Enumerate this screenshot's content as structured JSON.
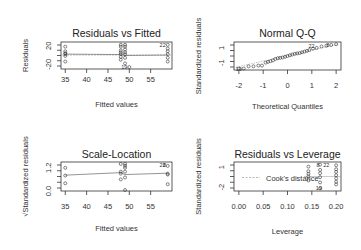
{
  "chart_data": [
    {
      "type": "scatter",
      "title": "Residuals vs Fitted",
      "xlabel": "Fitted values",
      "ylabel": "Residuals",
      "xlim": [
        34,
        60
      ],
      "ylim": [
        -30,
        28
      ],
      "xticks": [
        35,
        40,
        45,
        50,
        55
      ],
      "yticks": [
        -20,
        20
      ],
      "x": [
        35,
        35,
        35,
        35,
        35,
        35,
        48,
        48,
        48,
        48,
        48,
        48,
        48,
        49,
        49,
        49,
        49,
        49,
        49,
        49,
        50,
        59,
        59,
        59,
        59,
        59,
        59
      ],
      "y": [
        18,
        8,
        2,
        -2,
        -14,
        4,
        22,
        18,
        10,
        6,
        2,
        -4,
        -10,
        22,
        18,
        12,
        6,
        2,
        -6,
        -18,
        -26,
        22,
        14,
        8,
        2,
        -6,
        -14
      ],
      "smoother": [
        [
          35,
          2
        ],
        [
          48,
          1
        ],
        [
          49,
          -1
        ],
        [
          59,
          0
        ]
      ],
      "reference_line": 0,
      "labels": [
        {
          "text": "22",
          "x": 59,
          "y": 22
        },
        {
          "text": "19",
          "x": 50,
          "y": -26
        }
      ],
      "grid": false
    },
    {
      "type": "scatter",
      "title": "Normal Q-Q",
      "xlabel": "Theoretical Quantiles",
      "ylabel": "Standardized residuals",
      "xlim": [
        -2.2,
        2.2
      ],
      "ylim": [
        -2,
        1.8
      ],
      "xticks": [
        -2,
        -1,
        0,
        1,
        2
      ],
      "yticks": [
        -1,
        1
      ],
      "x": [
        -2.0,
        -1.8,
        -1.6,
        -1.4,
        -1.2,
        -1.05,
        -0.9,
        -0.8,
        -0.7,
        -0.6,
        -0.5,
        -0.4,
        -0.3,
        -0.2,
        -0.1,
        0.0,
        0.1,
        0.2,
        0.3,
        0.4,
        0.5,
        0.6,
        0.7,
        0.8,
        0.9,
        1.05,
        1.2,
        1.4,
        1.6,
        1.8,
        2.0
      ],
      "y": [
        -1.8,
        -1.8,
        -1.5,
        -1.5,
        -1.4,
        -1.4,
        -1.0,
        -0.9,
        -0.8,
        -0.7,
        -0.5,
        -0.4,
        -0.35,
        -0.3,
        -0.2,
        -0.1,
        0.0,
        0.1,
        0.2,
        0.25,
        0.3,
        0.4,
        0.5,
        0.6,
        0.7,
        0.9,
        1.0,
        1.2,
        1.3,
        1.4,
        1.5
      ],
      "reference_line": "qqline",
      "labels": [
        {
          "text": "19",
          "x": -1.8,
          "y": -1.8
        },
        {
          "text": "22",
          "x": 1.2,
          "y": 1.2
        },
        {
          "text": "8",
          "x": 1.8,
          "y": 1.4
        }
      ],
      "grid": false
    },
    {
      "type": "scatter",
      "title": "Scale-Location",
      "xlabel": "Fitted values",
      "ylabel": "√Standardized residuals",
      "xlim": [
        34,
        60
      ],
      "ylim": [
        0,
        1.5
      ],
      "xticks": [
        35,
        40,
        45,
        50,
        55
      ],
      "yticks": [
        0.0,
        1.2
      ],
      "x": [
        35,
        35,
        35,
        48,
        48,
        48,
        48,
        49,
        49,
        49,
        49,
        49,
        49,
        59,
        59,
        59,
        59
      ],
      "y": [
        1.2,
        0.8,
        0.4,
        1.4,
        1.0,
        0.9,
        0.6,
        1.4,
        1.3,
        1.2,
        1.0,
        0.7,
        0.05,
        1.3,
        0.9,
        0.85,
        0.35
      ],
      "smoother": [
        [
          35,
          0.82
        ],
        [
          48,
          0.95
        ],
        [
          49,
          0.85
        ],
        [
          59,
          0.92
        ]
      ],
      "labels": [
        {
          "text": "22",
          "x": 59,
          "y": 1.35
        },
        {
          "text": "8",
          "x": 59,
          "y": 1.35
        }
      ],
      "grid": false
    },
    {
      "type": "scatter",
      "title": "Residuals vs Leverage",
      "xlabel": "Leverage",
      "ylabel": "Standardized residuals",
      "xlim": [
        -0.01,
        0.21
      ],
      "ylim": [
        -2.6,
        1.8
      ],
      "xticks": [
        0.0,
        0.05,
        0.1,
        0.15,
        0.2
      ],
      "yticks": [
        -2,
        1
      ],
      "x": [
        0.143,
        0.143,
        0.143,
        0.143,
        0.143,
        0.167,
        0.167,
        0.167,
        0.167,
        0.167,
        0.167,
        0.2,
        0.2,
        0.2,
        0.2,
        0.2,
        0.2,
        0.2
      ],
      "y": [
        1.1,
        0.4,
        0.0,
        -0.4,
        -1.0,
        1.4,
        0.6,
        0.1,
        -0.5,
        -1.3,
        -2.2,
        1.3,
        0.7,
        0.3,
        -0.2,
        -0.7,
        -1.2,
        -1.6
      ],
      "legend": {
        "text": "Cook's distance",
        "style": "dashed",
        "position": "inside-center"
      },
      "labels": [
        {
          "text": "8",
          "x": 0.17,
          "y": 1.4
        },
        {
          "text": "22",
          "x": 0.19,
          "y": 1.3
        },
        {
          "text": "19",
          "x": 0.175,
          "y": -2.2
        }
      ],
      "grid": false
    }
  ]
}
